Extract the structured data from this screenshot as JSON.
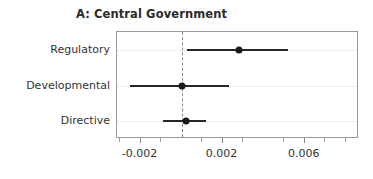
{
  "chart_data": {
    "type": "scatter",
    "title": "A: Central Government",
    "xlabel": "",
    "ylabel": "",
    "categories": [
      "Regulatory",
      "Developmental",
      "Directive"
    ],
    "values": [
      0.0028,
      0.0,
      0.0002
    ],
    "ci_low": [
      0.00024,
      -0.0025,
      -0.0009
    ],
    "ci_high": [
      0.0052,
      0.0023,
      0.0012
    ],
    "xlim": [
      -0.00315,
      0.00865
    ],
    "xticks": [
      -0.002,
      0.002,
      0.006
    ],
    "xtick_labels": [
      "-0.002",
      "0.002",
      "0.006"
    ],
    "xticks_minor": [
      -0.003,
      -0.001,
      0.001,
      0.003,
      0.005,
      0.007,
      0.008
    ],
    "reference_line": 0,
    "grid": "horizontal-dotted",
    "legend": "none",
    "marker_color": "#1a1a1a",
    "interval_color": "#262626",
    "reference_line_color": "#8a8a8a",
    "grid_color": "#e3d9d9",
    "frame_color": "#9a9a9a",
    "title_color": "#2b2b2b",
    "label_color": "#333333",
    "background_color": "#ffffff",
    "series": [
      {
        "name": "Regulatory",
        "estimate": 0.0028,
        "ci_low": 0.00024,
        "ci_high": 0.0052
      },
      {
        "name": "Developmental",
        "estimate": 0.0,
        "ci_low": -0.0025,
        "ci_high": 0.0023
      },
      {
        "name": "Directive",
        "estimate": 0.0002,
        "ci_low": -0.0009,
        "ci_high": 0.0012
      }
    ]
  }
}
